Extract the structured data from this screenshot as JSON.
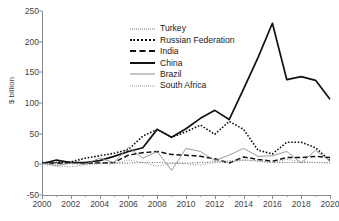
{
  "chart_data": {
    "type": "line",
    "title": "",
    "xlabel": "",
    "ylabel": "$ billion",
    "xlim": [
      2000,
      2020
    ],
    "ylim": [
      -50,
      250
    ],
    "yticks": [
      250,
      200,
      150,
      100,
      50,
      0,
      -50
    ],
    "xticks": [
      2000,
      2002,
      2004,
      2006,
      2008,
      2010,
      2012,
      2014,
      2016,
      2018,
      2020
    ],
    "xticks_minor_step": 1,
    "grid": false,
    "legend_position": "upper-left-inside",
    "x": [
      2000,
      2001,
      2002,
      2003,
      2004,
      2005,
      2006,
      2007,
      2008,
      2009,
      2010,
      2011,
      2012,
      2013,
      2014,
      2015,
      2016,
      2017,
      2018,
      2019,
      2020
    ],
    "series": [
      {
        "name": "Turkey",
        "style": "dotted-fine",
        "color": "#6f6f6f",
        "values": [
          1,
          1,
          1,
          1,
          2,
          2,
          2,
          3,
          3,
          2,
          2,
          3,
          4,
          4,
          7,
          5,
          3,
          3,
          3,
          3,
          3
        ]
      },
      {
        "name": "Russian Federation",
        "style": "dotted-med",
        "color": "#111111",
        "values": [
          3,
          3,
          4,
          10,
          14,
          18,
          24,
          46,
          57,
          44,
          53,
          64,
          49,
          70,
          57,
          23,
          17,
          36,
          36,
          27,
          6
        ]
      },
      {
        "name": "India",
        "style": "dashed",
        "color": "#111111",
        "values": [
          2,
          2,
          2,
          2,
          2,
          3,
          15,
          19,
          21,
          16,
          15,
          13,
          9,
          2,
          12,
          8,
          5,
          11,
          11,
          13,
          11
        ]
      },
      {
        "name": "China",
        "style": "solid-thick",
        "color": "#111111",
        "values": [
          1,
          7,
          3,
          3,
          6,
          13,
          21,
          27,
          57,
          44,
          58,
          75,
          88,
          73,
          123,
          174,
          230,
          138,
          143,
          137,
          106
        ]
      },
      {
        "name": "Brazil",
        "style": "solid-thin",
        "color": "#8d8d8d",
        "values": [
          2,
          -2,
          2,
          0,
          10,
          3,
          28,
          10,
          21,
          -10,
          26,
          21,
          6,
          15,
          26,
          13,
          14,
          21,
          2,
          23,
          5
        ]
      },
      {
        "name": "South Africa",
        "style": "dotted-gray",
        "color": "#9b9b9b",
        "values": [
          0,
          -3,
          -4,
          -1,
          1,
          1,
          7,
          3,
          -3,
          2,
          1,
          -1,
          3,
          6,
          7,
          6,
          3,
          8,
          5,
          3,
          2
        ]
      }
    ]
  }
}
